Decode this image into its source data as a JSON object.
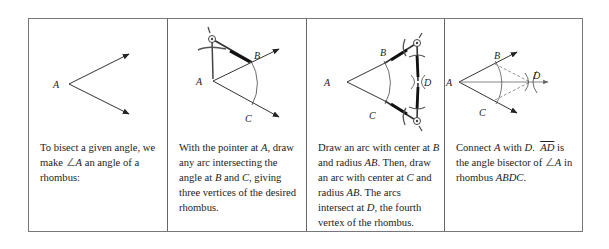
{
  "panels": [
    {
      "labels": {
        "A": "A"
      },
      "caption": {
        "line1": "To bisect a given angle, we",
        "line2_pre": "make ",
        "angle_symbol": "∠",
        "line2_var": "A",
        "line2_post": " an angle of a",
        "line3": "rhombus:"
      }
    },
    {
      "labels": {
        "A": "A",
        "B": "B",
        "C": "C"
      },
      "caption": {
        "l1_pre": "With the pointer at ",
        "l1_var": "A",
        "l1_post": ", draw",
        "l2": "any arc intersecting the",
        "l3_pre": "angle at ",
        "l3_var1": "B",
        "l3_mid": " and ",
        "l3_var2": "C",
        "l3_post": ", giving",
        "l4": "three vertices of the desired",
        "l5": "rhombus."
      }
    },
    {
      "labels": {
        "A": "A",
        "B": "B",
        "C": "C",
        "D": "D"
      },
      "caption": {
        "l1_pre": "Draw an arc with center at ",
        "l1_var": "B",
        "l2_pre": "and radius ",
        "l2_var": "AB",
        "l2_post": ". Then, draw",
        "l3_pre": "an arc with center at ",
        "l3_var": "C",
        "l3_post": " and",
        "l4_pre": "radius ",
        "l4_var": "AB",
        "l4_post": ". The arcs",
        "l5_pre": "intersect at ",
        "l5_var": "D",
        "l5_post": ", the fourth",
        "l6": "vertex of the rhombus."
      }
    },
    {
      "labels": {
        "A": "A",
        "B": "B",
        "C": "C",
        "D": "D"
      },
      "caption": {
        "l1_pre": "Connect ",
        "l1_var1": "A",
        "l1_mid": " with ",
        "l1_var2": "D",
        "l1_sep": ".  ",
        "l1_ray": "AD",
        "l1_post": " is",
        "l2_pre": "the angle bisector of ",
        "angle_symbol": "∠",
        "l2_var": "A",
        "l2_post": " in",
        "l3_pre": "rhombus ",
        "l3_var": "ABDC",
        "l3_post": "."
      }
    }
  ]
}
